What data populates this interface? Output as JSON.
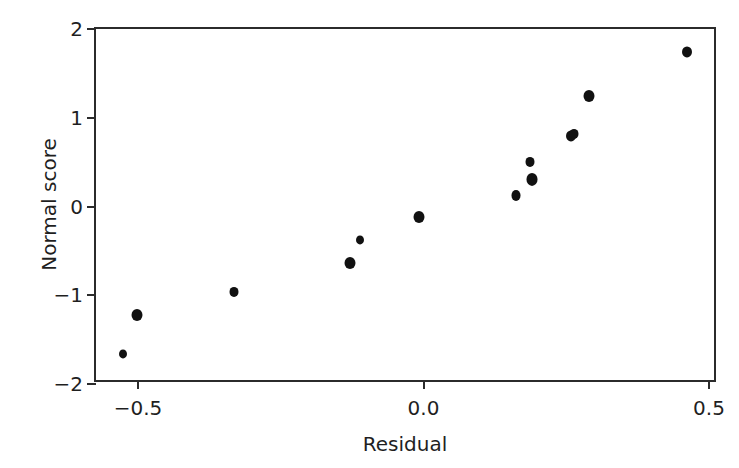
{
  "chart_data": {
    "type": "scatter",
    "title": "",
    "xlabel": "Residual",
    "ylabel": "Normal score",
    "xlim": [
      -0.62,
      0.515
    ],
    "ylim": [
      -2.0,
      2.0
    ],
    "xticks": [
      -0.5,
      0.0,
      0.5
    ],
    "xticklabels": [
      "−0.5",
      "0.0",
      "0.5"
    ],
    "yticks": [
      -2,
      -1,
      0,
      1,
      2
    ],
    "yticklabels": [
      "−2",
      "−1",
      "0",
      "1",
      "2"
    ],
    "grid": false,
    "legend": null,
    "marker": "filled-circle",
    "marker_color": "#111111",
    "frame_color": "#2b2b2b",
    "background": "#ffffff",
    "n_points": 13,
    "x": [
      -0.527,
      -0.502,
      -0.332,
      -0.129,
      -0.112,
      -0.008,
      0.162,
      0.187,
      0.19,
      0.259,
      0.263,
      0.29,
      0.461
    ],
    "y": [
      -1.665,
      -1.225,
      -0.965,
      -0.635,
      -0.375,
      -0.115,
      0.125,
      0.305,
      0.505,
      0.795,
      0.815,
      1.245,
      1.745
    ],
    "points": [
      {
        "x": -0.527,
        "y": -1.665,
        "r": 4.0
      },
      {
        "x": -0.502,
        "y": -1.225,
        "r": 5.5
      },
      {
        "x": -0.332,
        "y": -0.965,
        "r": 4.5
      },
      {
        "x": -0.129,
        "y": -0.635,
        "r": 5.5
      },
      {
        "x": -0.112,
        "y": -0.375,
        "r": 4.0
      },
      {
        "x": -0.008,
        "y": -0.115,
        "r": 5.5
      },
      {
        "x": 0.162,
        "y": 0.125,
        "r": 4.5
      },
      {
        "x": 0.19,
        "y": 0.305,
        "r": 5.5
      },
      {
        "x": 0.187,
        "y": 0.505,
        "r": 4.5
      },
      {
        "x": 0.259,
        "y": 0.795,
        "r": 5.0
      },
      {
        "x": 0.263,
        "y": 0.815,
        "r": 4.5
      },
      {
        "x": 0.29,
        "y": 1.245,
        "r": 5.5
      },
      {
        "x": 0.461,
        "y": 1.745,
        "r": 5.0
      }
    ]
  }
}
